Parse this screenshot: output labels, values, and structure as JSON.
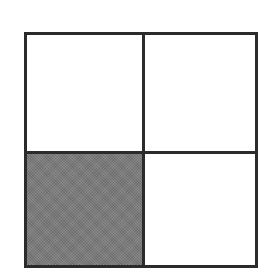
{
  "diagram": {
    "type": "grid",
    "rows": 2,
    "cols": 2,
    "cells": [
      {
        "row": 0,
        "col": 0,
        "shaded": false
      },
      {
        "row": 0,
        "col": 1,
        "shaded": false
      },
      {
        "row": 1,
        "col": 0,
        "shaded": true
      },
      {
        "row": 1,
        "col": 1,
        "shaded": false
      }
    ],
    "colors": {
      "border": "#2b2b2b",
      "shaded_fill": "#7a7a7a",
      "empty_fill": "#ffffff"
    },
    "shaded_fraction": "1/4"
  }
}
